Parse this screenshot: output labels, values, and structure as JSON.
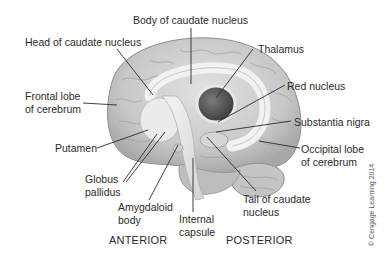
{
  "figure": {
    "labels": {
      "body_caudate": "Body of caudate nucleus",
      "head_caudate": "Head of caudate nucleus",
      "thalamus": "Thalamus",
      "frontal_lobe_1": "Frontal lobe",
      "frontal_lobe_2": "of cerebrum",
      "red_nucleus": "Red nucleus",
      "substantia_nigra": "Substantia nigra",
      "putamen": "Putamen",
      "occipital_lobe_1": "Occipital lobe",
      "occipital_lobe_2": "of cerebrum",
      "globus_pallidus_1": "Globus",
      "globus_pallidus_2": "pallidus",
      "amygdaloid_1": "Amygdaloid",
      "amygdaloid_2": "body",
      "tail_caudate_1": "Tail of caudate",
      "tail_caudate_2": "nucleus",
      "internal_capsule_1": "Internal",
      "internal_capsule_2": "capsule"
    },
    "orientation": {
      "anterior": "ANTERIOR",
      "posterior": "POSTERIOR"
    },
    "copyright": "© Cengage Learning 2014",
    "colors": {
      "cortex": "#cfcfcf",
      "cortex_dark": "#9a9a9a",
      "caudate": "#ececec",
      "thalamus": "#5a5a5a",
      "leader_line": "#2b2b2b"
    }
  }
}
